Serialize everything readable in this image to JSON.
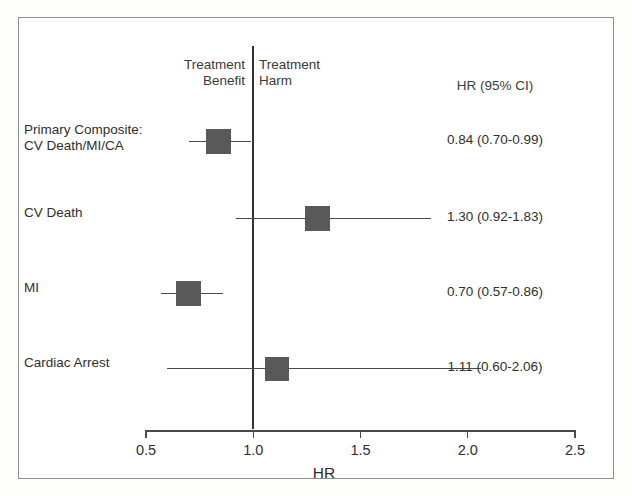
{
  "chart_data": {
    "type": "forest",
    "title": "",
    "xlabel": "HR",
    "ylabel": "",
    "xlim": [
      0.5,
      2.5
    ],
    "xticks": [
      "0.5",
      "1.0",
      "1.5",
      "2.0",
      "2.5"
    ],
    "xtick_values": [
      0.5,
      1.0,
      1.5,
      2.0,
      2.5
    ],
    "reference_line": 1.0,
    "grid": false,
    "legend": "none",
    "value_column_header": "HR (95% CI)",
    "side_labels": {
      "left": "Treatment\nBenefit",
      "right": "Treatment\nHarm"
    },
    "categories": [
      "Primary Composite:\nCV Death/MI/CA",
      "CV Death",
      "MI",
      "Cardiac Arrest"
    ],
    "rows": [
      {
        "label": "Primary Composite:\nCV Death/MI/CA",
        "hr": 0.84,
        "ci_low": 0.7,
        "ci_high": 0.99,
        "value_text": "0.84 (0.70-0.99)",
        "marker_weight": 1.0
      },
      {
        "label": "CV Death",
        "hr": 1.3,
        "ci_low": 0.92,
        "ci_high": 1.83,
        "value_text": "1.30 (0.92-1.83)",
        "marker_weight": 0.92
      },
      {
        "label": "MI",
        "hr": 0.7,
        "ci_low": 0.57,
        "ci_high": 0.86,
        "value_text": "0.70 (0.57-0.86)",
        "marker_weight": 0.9
      },
      {
        "label": "Cardiac Arrest",
        "hr": 1.11,
        "ci_low": 0.6,
        "ci_high": 2.06,
        "value_text": "1.11 (0.60-2.06)",
        "marker_weight": 0.82
      }
    ],
    "colors": {
      "marker": "#595959",
      "line": "#4a4a4a",
      "reference": "#333333",
      "text": "#2f2f2f",
      "frame": "#8d8d8d",
      "background": "#ffffff"
    }
  }
}
